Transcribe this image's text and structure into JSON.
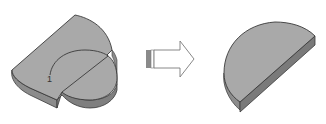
{
  "diagram": {
    "type": "cad-split-operation",
    "source_part": {
      "label": "1",
      "description": "Flat plate with rounded ends and a circular split line"
    },
    "arrow": {
      "direction": "right",
      "description": "transformation arrow"
    },
    "result_part": {
      "description": "Half-disc solid body after split"
    },
    "colors": {
      "top_face": "#a9a9a9",
      "side_face": "#8c8c8c",
      "side_dark": "#7a7a7a",
      "edge": "#3a3a3a",
      "arrow_fill": "#ffffff",
      "arrow_tail": "#8a8a8a",
      "background": "#ffffff"
    }
  }
}
